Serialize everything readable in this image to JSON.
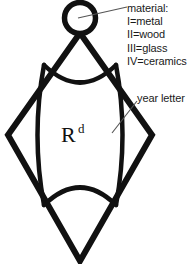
{
  "figure": {
    "background_color": "#ffffff",
    "stroke_color": "#111111",
    "text_color": "#1a1a1a"
  },
  "mark": {
    "letter": "R",
    "superscript": "d"
  },
  "annotations": {
    "material": {
      "heading": "material:",
      "entries": [
        "I=metal",
        "II=wood",
        "III=glass",
        "IV=ceramics"
      ]
    },
    "year_letter": {
      "label": "year letter"
    }
  },
  "shapes": {
    "circle_name": "material-circle",
    "lozenge_name": "diamond-outline",
    "top_arc_name": "top-inner-arc",
    "bottom_arc_name": "bottom-inner-arc",
    "left_curve_name": "left-inner-curve",
    "right_curve_name": "right-inner-curve"
  }
}
